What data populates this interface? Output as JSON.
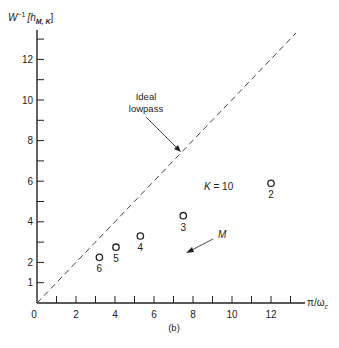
{
  "figure": {
    "panel_label": "(b)",
    "ylabel_main": "W",
    "ylabel_sup": "−1",
    "ylabel_bracket": "[h",
    "ylabel_sub": "M, K",
    "ylabel_close": "]",
    "xlabel_main": "π/ω",
    "xlabel_sub": "c",
    "annotation_ideal_line1": "Ideal",
    "annotation_ideal_line2": "lowpass",
    "annotation_k": "K = 10",
    "annotation_m": "M"
  },
  "chart_data": {
    "type": "scatter",
    "title": "",
    "panel_label": "(b)",
    "xlabel": "π/ω_c",
    "ylabel": "W^{-1}[h_{M,K}]",
    "xlim": [
      0,
      13.5
    ],
    "ylim": [
      0,
      13.5
    ],
    "grid": false,
    "legend": null,
    "x_ticks": [
      0,
      1,
      2,
      3,
      4,
      5,
      6,
      7,
      8,
      9,
      10,
      11,
      12,
      13
    ],
    "x_tick_labels": [
      "0",
      "",
      "2",
      "",
      "4",
      "",
      "6",
      "",
      "8",
      "",
      "10",
      "",
      "12",
      ""
    ],
    "y_ticks": [
      1,
      2,
      3,
      4,
      5,
      6,
      7,
      8,
      9,
      10,
      11,
      12,
      13
    ],
    "y_tick_labels": [
      "1",
      "2",
      "",
      "4",
      "",
      "6",
      "",
      "8",
      "",
      "10",
      "",
      "12",
      ""
    ],
    "series": [
      {
        "name": "Ideal lowpass",
        "style": "dashed line",
        "x": [
          0,
          13.3
        ],
        "y": [
          0,
          13.3
        ]
      },
      {
        "name": "K = 10",
        "style": "open circles",
        "points": [
          {
            "label": "2",
            "x": 12.0,
            "y": 5.9
          },
          {
            "label": "3",
            "x": 7.5,
            "y": 4.3
          },
          {
            "label": "4",
            "x": 5.3,
            "y": 3.3
          },
          {
            "label": "5",
            "x": 4.05,
            "y": 2.75
          },
          {
            "label": "6",
            "x": 3.2,
            "y": 2.25
          }
        ]
      }
    ],
    "annotations": [
      {
        "text": "Ideal lowpass",
        "arrow_to": "dashed line"
      },
      {
        "text": "K = 10"
      },
      {
        "text": "M",
        "arrow_direction": "toward increasing M (down-left)"
      }
    ]
  }
}
